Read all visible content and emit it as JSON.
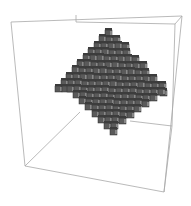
{
  "figure": {
    "width": 191,
    "height": 206,
    "colors": {
      "background": "#ffffff",
      "box_edge": "#a8a8a8",
      "cube_face": "#5a5a5a",
      "cube_dark": "#3c3c3c",
      "cube_highlight": "#b8b8b8",
      "cube_edge": "#2e2e2e"
    },
    "bounding_box": {
      "front_edges": [
        [
          11,
          22,
          182,
          16
        ],
        [
          11,
          22,
          25,
          166
        ],
        [
          182,
          16,
          164,
          192
        ],
        [
          25,
          166,
          164,
          192
        ]
      ],
      "back_edges": [
        [
          76,
          15,
          76,
          22
        ],
        [
          76,
          22,
          175,
          24
        ],
        [
          175,
          24,
          172,
          126
        ],
        [
          182,
          16,
          175,
          24
        ],
        [
          25,
          166,
          80,
          112
        ],
        [
          172,
          126,
          130,
          121
        ],
        [
          172,
          126,
          164,
          192
        ]
      ]
    },
    "octahedron": {
      "top": [
        110,
        24
      ],
      "left": [
        55,
        80
      ],
      "right": [
        171,
        89
      ],
      "bottom": [
        110,
        141
      ],
      "equator_y": 86,
      "cube_size": 7,
      "layers_upper": 10,
      "layers_lower": 9
    }
  }
}
